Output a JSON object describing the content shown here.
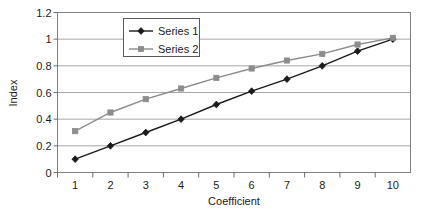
{
  "chart_data": {
    "type": "line",
    "title": "",
    "xlabel": "Coefficient",
    "ylabel": "Index",
    "x": [
      1,
      2,
      3,
      4,
      5,
      6,
      7,
      8,
      9,
      10
    ],
    "xtick_labels": [
      "1",
      "2",
      "3",
      "4",
      "5",
      "6",
      "7",
      "8",
      "9",
      "10"
    ],
    "ytick_labels": [
      "0",
      "0.2",
      "0.4",
      "0.6",
      "0.8",
      "1",
      "1.2"
    ],
    "yticks": [
      0,
      0.2,
      0.4,
      0.6,
      0.8,
      1,
      1.2
    ],
    "xlim": [
      0.5,
      10.5
    ],
    "ylim": [
      0,
      1.2
    ],
    "grid": "horizontal",
    "legend_position": "top-center-inside",
    "series": [
      {
        "name": "Series 1",
        "color": "#1a1a1a",
        "marker": "diamond",
        "values": [
          0.1,
          0.2,
          0.3,
          0.4,
          0.51,
          0.61,
          0.7,
          0.8,
          0.91,
          1.0
        ]
      },
      {
        "name": "Series 2",
        "color": "#8c8c8c",
        "marker": "square",
        "values": [
          0.31,
          0.45,
          0.55,
          0.63,
          0.71,
          0.78,
          0.84,
          0.89,
          0.96,
          1.01
        ]
      }
    ]
  },
  "legend": {
    "entries": [
      {
        "label": "Series 1"
      },
      {
        "label": "Series 2"
      }
    ]
  },
  "axes": {
    "x_title": "Coefficient",
    "y_title": "Index"
  }
}
